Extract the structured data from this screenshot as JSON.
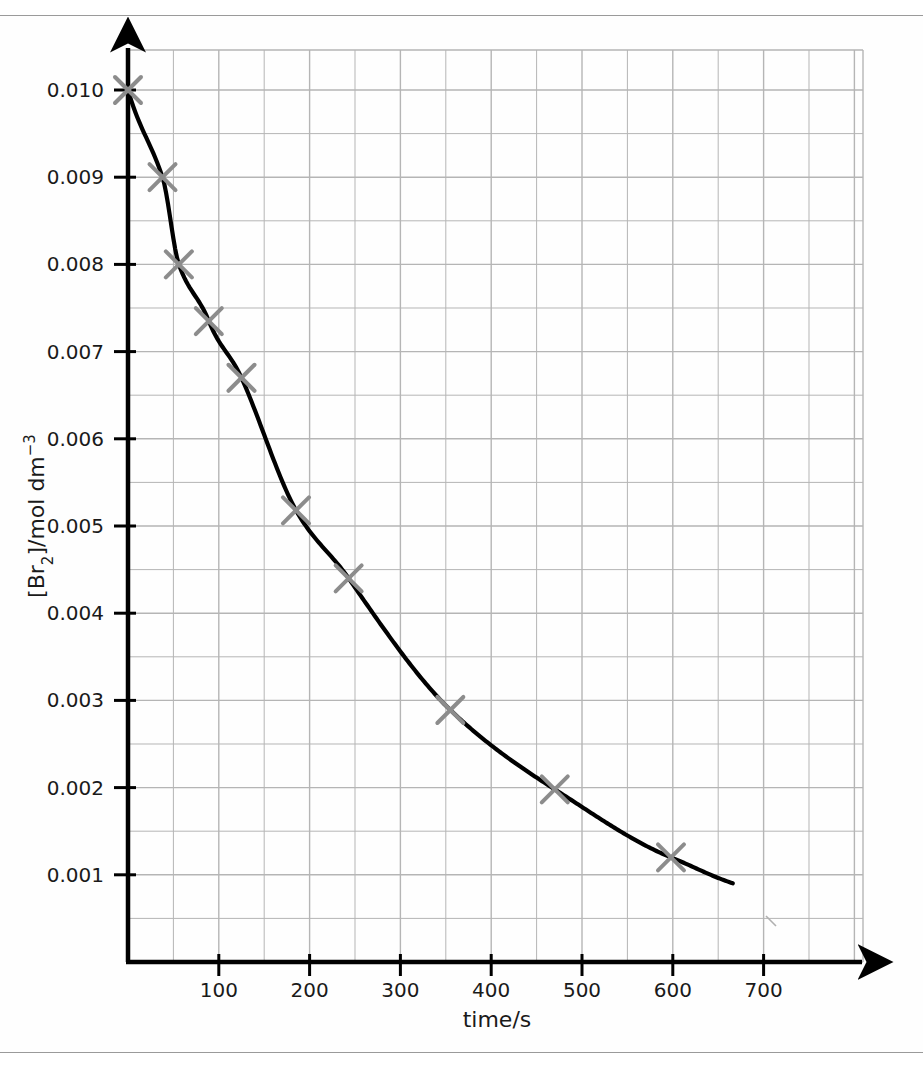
{
  "chart_data": {
    "type": "scatter",
    "title": "",
    "xlabel": "time/s",
    "ylabel": "[Br2]/mol dm-3",
    "ylabel_parts": {
      "pre": "[Br",
      "sub": "2",
      "mid": "]/mol dm",
      "sup": "−3"
    },
    "xlabel_text": "time/s",
    "xlim": [
      0,
      770
    ],
    "ylim": [
      0,
      0.0105
    ],
    "x_ticks": [
      100,
      200,
      300,
      400,
      500,
      600,
      700
    ],
    "x_tick_labels": [
      "100",
      "200",
      "300",
      "400",
      "500",
      "600",
      "700"
    ],
    "y_ticks": [
      0.001,
      0.002,
      0.003,
      0.004,
      0.005,
      0.006,
      0.007,
      0.008,
      0.009,
      0.01
    ],
    "y_tick_labels": [
      "0.001",
      "0.002",
      "0.003",
      "0.004",
      "0.005",
      "0.006",
      "0.007",
      "0.008",
      "0.009",
      "0.010"
    ],
    "x_minor_step": 50,
    "y_minor_step": 0.0005,
    "grid": true,
    "legend": "none",
    "marker": "x-cross",
    "marker_color": "#8c8c8c",
    "curve_color": "#000000",
    "axis_color": "#000000",
    "grid_color": "#b5b5b5",
    "x": [
      0,
      38,
      56,
      89,
      125,
      185,
      243,
      355,
      470,
      598
    ],
    "y": [
      0.01,
      0.009,
      0.008,
      0.00735,
      0.0067,
      0.00518,
      0.0044,
      0.00289,
      0.00198,
      0.0012
    ],
    "points": [
      {
        "t": 0,
        "c": 0.01
      },
      {
        "t": 38,
        "c": 0.009
      },
      {
        "t": 56,
        "c": 0.008
      },
      {
        "t": 89,
        "c": 0.00735
      },
      {
        "t": 125,
        "c": 0.0067
      },
      {
        "t": 185,
        "c": 0.00518
      },
      {
        "t": 243,
        "c": 0.0044
      },
      {
        "t": 355,
        "c": 0.00289
      },
      {
        "t": 470,
        "c": 0.00198
      },
      {
        "t": 598,
        "c": 0.0012
      }
    ],
    "curve_note": "smooth exponential decay best-fit curve from t=0 to t=667",
    "curve_end": {
      "t": 667,
      "c": 0.0009
    }
  },
  "axes": {
    "y_axis_title": "[Br2]/mol dm-3",
    "x_axis_title": "time/s"
  }
}
